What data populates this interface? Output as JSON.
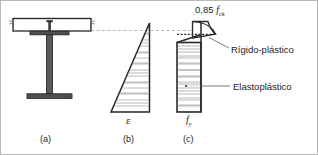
{
  "figure": {
    "background": "#ffffff",
    "border_color": "#b9b9b9",
    "line_color": "#1d1d1d",
    "hatch_color": "#8f8f8f",
    "steel_fill": "#4a4a4a",
    "slab_fill": "#ffffff"
  },
  "labels": {
    "concrete_stress": {
      "coefficient": "0,85",
      "symbol": "f",
      "subscript": "ck",
      "full": "0,85 fck"
    },
    "rigid_plastic": "Rígido-plástico",
    "elastoplastic": "Elastoplástico",
    "strain_symbol": "ε",
    "steel_yield_symbol": "f",
    "steel_yield_subscript": "y"
  },
  "captions": {
    "a": "(a)",
    "b": "(b)",
    "c": "(c)"
  },
  "panels": [
    {
      "id": "a",
      "caption": "(a)",
      "description": "Composite cross-section: concrete slab over steel I-beam with shear stud"
    },
    {
      "id": "b",
      "caption": "(b)",
      "description": "Strain distribution diagram, linear triangular profile",
      "axis_label": "ε"
    },
    {
      "id": "c",
      "caption": "(c)",
      "description": "Stress distribution diagram, rectangular plastic block",
      "axis_label": "fy"
    }
  ]
}
